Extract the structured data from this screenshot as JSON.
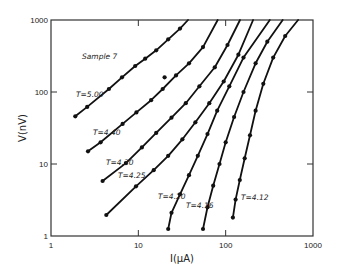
{
  "chart_data": {
    "type": "line",
    "title": "",
    "annotation": "Sample 7",
    "xlabel": "I(μA)",
    "ylabel": "V(nV)",
    "xscale": "log",
    "yscale": "log",
    "xlim": [
      1,
      1000
    ],
    "ylim": [
      1,
      1000
    ],
    "xticks": [
      "1",
      "10",
      "100",
      "1000"
    ],
    "yticks": [
      "1",
      "10",
      "100",
      "1000"
    ],
    "grid": false,
    "legend": "none (inline curve labels)",
    "series": [
      {
        "name": "T=5.00",
        "points": [
          [
            1.9,
            46
          ],
          [
            2.6,
            62
          ],
          [
            4.6,
            110
          ],
          [
            6.5,
            160
          ],
          [
            9.2,
            230
          ],
          [
            12,
            290
          ],
          [
            16,
            380
          ],
          [
            22,
            540
          ],
          [
            30,
            760
          ],
          [
            37,
            1000
          ]
        ]
      },
      {
        "name": "T=4.40",
        "points": [
          [
            2.65,
            15
          ],
          [
            3.7,
            20
          ],
          [
            6.6,
            36
          ],
          [
            9.5,
            52
          ],
          [
            14,
            77
          ],
          [
            19,
            110
          ],
          [
            27,
            170
          ],
          [
            38,
            250
          ],
          [
            55,
            420
          ],
          [
            81,
            1000
          ]
        ],
        "outlier": [
          20,
          160
        ]
      },
      {
        "name": "T=4.30",
        "points": [
          [
            3.9,
            5.8
          ],
          [
            7.2,
            10.3
          ],
          [
            11,
            17
          ],
          [
            16,
            27
          ],
          [
            24,
            44
          ],
          [
            35,
            70
          ],
          [
            50,
            120
          ],
          [
            75,
            220
          ],
          [
            105,
            450
          ],
          [
            146,
            1000
          ]
        ]
      },
      {
        "name": "T=4.25",
        "points": [
          [
            4.3,
            1.96
          ],
          [
            9.4,
            4.9
          ],
          [
            15,
            8.2
          ],
          [
            22,
            13
          ],
          [
            32,
            22
          ],
          [
            45,
            38
          ],
          [
            65,
            70
          ],
          [
            95,
            140
          ],
          [
            140,
            330
          ],
          [
            206,
            1000
          ]
        ]
      },
      {
        "name": "T=4.20",
        "points": [
          [
            22,
            1.25
          ],
          [
            24,
            2.1
          ],
          [
            30,
            3.8
          ],
          [
            38,
            7
          ],
          [
            48,
            13
          ],
          [
            62,
            26
          ],
          [
            80,
            55
          ],
          [
            110,
            120
          ],
          [
            160,
            300
          ],
          [
            320,
            1000
          ]
        ]
      },
      {
        "name": "T=4.16",
        "points": [
          [
            55,
            1.25
          ],
          [
            62,
            2.5
          ],
          [
            72,
            5
          ],
          [
            85,
            10
          ],
          [
            100,
            20
          ],
          [
            125,
            45
          ],
          [
            160,
            100
          ],
          [
            220,
            250
          ],
          [
            300,
            500
          ],
          [
            450,
            1000
          ]
        ]
      },
      {
        "name": "T=4.12",
        "points": [
          [
            121,
            1.8
          ],
          [
            130,
            3.2
          ],
          [
            145,
            6
          ],
          [
            165,
            12
          ],
          [
            190,
            25
          ],
          [
            220,
            55
          ],
          [
            270,
            130
          ],
          [
            350,
            300
          ],
          [
            480,
            600
          ],
          [
            675,
            1000
          ]
        ]
      }
    ]
  },
  "plot_box": {
    "left": 51,
    "right": 313,
    "top": 20,
    "bottom": 236
  },
  "labels": {
    "sample": "Sample 7",
    "xlabel": "I(μA)",
    "ylabel": "V(nV)",
    "x_ticks": [
      "1",
      "10",
      "100",
      "1000"
    ],
    "y_ticks": [
      "1000",
      "100",
      "10",
      "1"
    ],
    "curves": [
      "T=5.00",
      "T=4.40",
      "T=4.30",
      "T=4.25",
      "T=4.20",
      "T=4.16",
      "T=4.12"
    ]
  }
}
